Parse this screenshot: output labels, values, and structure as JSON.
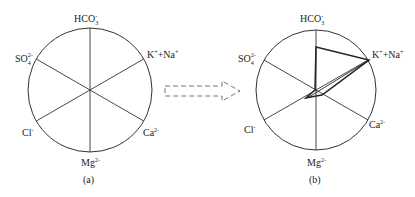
{
  "figure": {
    "arrow": {
      "style": "dashed",
      "direction": "right"
    },
    "panels": [
      {
        "id": "a",
        "caption": "(a)",
        "center": [
          90,
          90
        ],
        "radius": 62,
        "axes": [
          {
            "name": "HCO3",
            "label": "HCO",
            "sub": "3",
            "sup": "-",
            "angle": 90
          },
          {
            "name": "K+Na",
            "label": "K",
            "sup": "+",
            "label2": "+Na",
            "sup2": "+",
            "angle": 30
          },
          {
            "name": "Ca",
            "label": "Ca",
            "sup": "2-",
            "angle": -30
          },
          {
            "name": "Mg",
            "label": "Mg",
            "sup": "2-",
            "angle": -90
          },
          {
            "name": "Cl",
            "label": "Cl",
            "sup": "-",
            "angle": -150
          },
          {
            "name": "SO4",
            "label": "SO",
            "sub": "4",
            "sup": "2-",
            "angle": 150
          }
        ],
        "polygon": null
      },
      {
        "id": "b",
        "caption": "(b)",
        "center": [
          316,
          90
        ],
        "radius": 60,
        "axes": [
          {
            "name": "HCO3",
            "label": "HCO",
            "sub": "3",
            "sup": "-",
            "angle": 90
          },
          {
            "name": "K+Na",
            "label": "K",
            "sup": "+",
            "label2": "+Na",
            "sup2": "+",
            "angle": 30
          },
          {
            "name": "Ca",
            "label": "Ca",
            "sup": "2-",
            "angle": -30
          },
          {
            "name": "Mg",
            "label": "Mg",
            "sup": "2-",
            "angle": -90
          },
          {
            "name": "Cl",
            "label": "Cl",
            "sup": "-",
            "angle": -150
          },
          {
            "name": "SO4",
            "label": "SO",
            "sub": "4",
            "sup": "2-",
            "angle": 150
          }
        ],
        "polygon_relative_values": {
          "HCO3": 0.72,
          "K+Na": 1.0,
          "Ca": 0.08,
          "Mg": 0.05,
          "Cl": 0.2,
          "SO4": 0.02
        }
      }
    ]
  },
  "labels": {
    "a": {
      "hco3": "HCO",
      "hco3_sub": "3",
      "hco3_sup": "-",
      "kna_k": "K",
      "kna_ksup": "+",
      "kna_na": "+Na",
      "kna_nasup": "+",
      "ca": "Ca",
      "ca_sup": "2-",
      "mg": "Mg",
      "mg_sup": "2-",
      "cl": "Cl",
      "cl_sup": "-",
      "so4": "SO",
      "so4_sub": "4",
      "so4_sup": "2-",
      "caption": "(a)"
    },
    "b": {
      "hco3": "HCO",
      "hco3_sub": "3",
      "hco3_sup": "-",
      "kna_k": "K",
      "kna_ksup": "+",
      "kna_na": "+Na",
      "kna_nasup": "+",
      "ca": "Ca",
      "ca_sup": "2-",
      "mg": "Mg",
      "mg_sup": "2-",
      "cl": "Cl",
      "cl_sup": "-",
      "so4": "SO",
      "so4_sub": "4",
      "so4_sup": "2-",
      "caption": "(b)"
    }
  }
}
